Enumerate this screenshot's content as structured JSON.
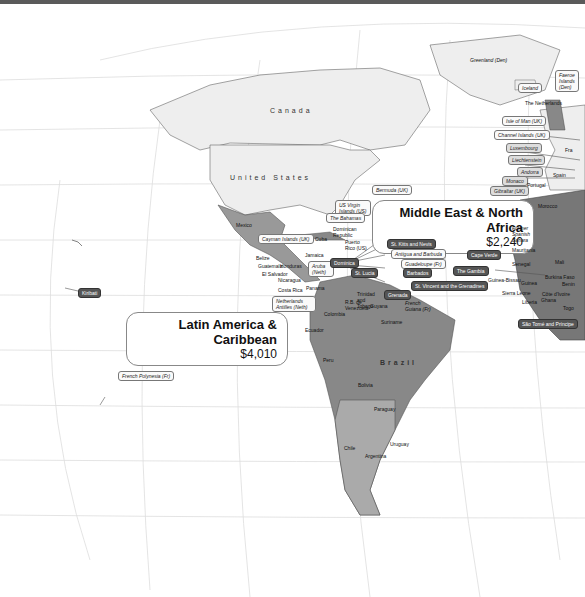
{
  "regions": {
    "latin_america": {
      "title": "Latin America & Caribbean",
      "value": "$4,010"
    },
    "middle_east": {
      "title": "Middle East & North Africa",
      "value": "$2,240"
    }
  },
  "countries": {
    "canada": "Canada",
    "usa": "United States",
    "brazil": "Brazil"
  },
  "labels": {
    "greenland": "Greenland (Den)",
    "iceland": "Iceland",
    "faeroe": "Faeroe Islands (Den)",
    "netherlands": "The Netherlands",
    "isle_of_man": "Isle of Man (UK)",
    "channel_islands": "Channel Islands (UK)",
    "luxembourg": "Luxembourg",
    "liechtenstein": "Liechtenstein",
    "andorra": "Andorra",
    "monaco": "Monaco",
    "gibraltar": "Gibraltar (UK)",
    "portugal": "Portugal",
    "spain": "Spain",
    "france": "Fra",
    "morocco": "Morocco",
    "bermuda": "Bermuda (UK)",
    "us_virgin": "US Virgin Islands (US)",
    "bahamas": "The Bahamas",
    "dominican": "Dominican Republic",
    "puerto_rico": "Puerto Rico (US)",
    "cayman": "Cayman Islands (UK)",
    "cuba": "Cuba",
    "mexico": "Mexico",
    "jamaica": "Jamaica",
    "belize": "Belize",
    "guatemala": "Guatemala",
    "honduras": "Honduras",
    "el_salvador": "El Salvador",
    "nicaragua": "Nicaragua",
    "costa_rica": "Costa Rica",
    "panama": "Panama",
    "aruba": "Aruba (Neth)",
    "neth_antilles": "Netherlands Antilles (Neth)",
    "dominica": "Dominica",
    "st_lucia": "St. Lucia",
    "st_kitts": "St. Kitts and Nevis",
    "antigua": "Antigua and Barbuda",
    "guadeloupe": "Guadeloupe (Fr)",
    "barbados": "Barbados",
    "st_vincent": "St. Vincent and the Grenadines",
    "grenada": "Grenada",
    "trinidad": "Trinidad and Tobago",
    "venezuela": "R.B. de Venezuela",
    "guyana": "Guyana",
    "suriname": "Suriname",
    "french_guiana": "French Guiana (Fr)",
    "colombia": "Colombia",
    "ecuador": "Ecuador",
    "peru": "Peru",
    "bolivia": "Bolivia",
    "paraguay": "Paraguay",
    "chile": "Chile",
    "argentina": "Argentina",
    "uruguay": "Uruguay",
    "cape_verde": "Cape Verde",
    "gambia": "The Gambia",
    "guinea_bissau": "Guinea-Bissau",
    "guinea": "Guinea",
    "sierra_leone": "Sierra Leone",
    "liberia": "Liberia",
    "cote": "Côte d'Ivoire",
    "ghana": "Ghana",
    "togo": "Togo",
    "burkina": "Burkina Faso",
    "benin": "Benin",
    "mali": "Mali",
    "senegal": "Senegal",
    "mauritania": "Mauritania",
    "western_sahara": "Former Spanish Sahara",
    "sao_tome": "São Tomé and Príncipe",
    "kiribati": "Kiribati",
    "french_polynesia": "French Polynesia (Fr)"
  }
}
